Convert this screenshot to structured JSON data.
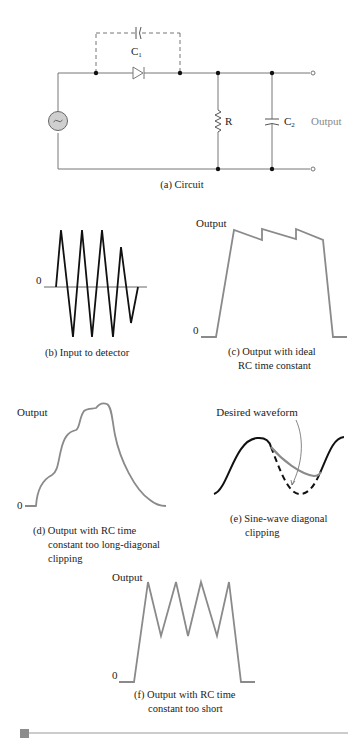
{
  "figure": {
    "panels": {
      "a": {
        "caption": "(a) Circuit",
        "components": {
          "c1": "C",
          "c1_sub": "1",
          "r": "R",
          "c2": "C",
          "c2_sub": "2",
          "source_symbol": "~",
          "output_label": "Output"
        }
      },
      "b": {
        "caption": "(b) Input to detector",
        "zero_label": "0"
      },
      "c": {
        "caption_line1": "(c) Output with ideal",
        "caption_line2": "RC time constant",
        "y_label": "Output",
        "zero_label": "0"
      },
      "d": {
        "caption_line1": "(d) Output with RC time",
        "caption_line2": "constant too long-diagonal",
        "caption_line3": "clipping",
        "y_label": "Output",
        "zero_label": "0"
      },
      "e": {
        "caption_line1": "(e) Sine-wave diagonal",
        "caption_line2": "clipping",
        "annotation": "Desired waveform"
      },
      "f": {
        "caption_line1": "(f) Output with RC time",
        "caption_line2": "constant too short",
        "y_label": "Output",
        "zero_label": "0"
      }
    },
    "colors": {
      "wire": "#777777",
      "node": "#111111",
      "waveform_black": "#111111",
      "waveform_grey": "#8a8a8a",
      "source_fill": "#cfcfcf",
      "rule": "#9a9a9a",
      "rule_marker": "#8c8c8c"
    }
  }
}
